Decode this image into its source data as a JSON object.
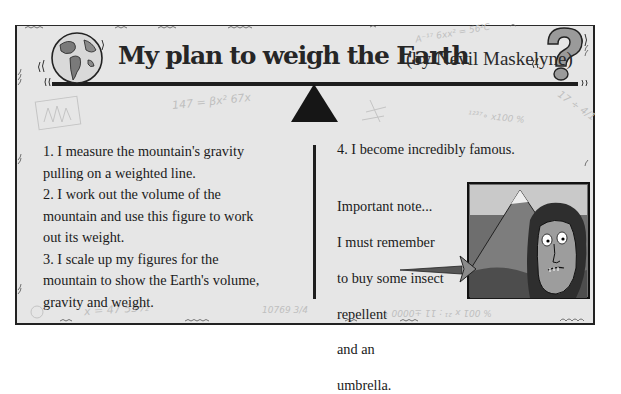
{
  "title": {
    "main": "My plan to weigh the Earth",
    "byline": "(by Nevil Maskelyne)"
  },
  "icons": {
    "left": "globe-icon",
    "right": "question-mark-icon",
    "center": "seesaw-fulcrum-icon"
  },
  "steps": [
    {
      "number": "1.",
      "text": "I measure the mountain's gravity pulling on a weighted line."
    },
    {
      "number": "2.",
      "text": "I work out the volume of the mountain and use this figure to work out its weight."
    },
    {
      "number": "3.",
      "text": "I scale up my figures for the mountain to show the Earth's volume, gravity and weight."
    },
    {
      "number": "4.",
      "text": "I become incredibly famous."
    }
  ],
  "step_lines": {
    "l1": "1.  I measure the mountain's gravity",
    "l2": "pulling on a weighted line.",
    "l3": "2.  I work out the volume of the",
    "l4": "mountain and use this figure to work",
    "l5": "out its weight.",
    "l6": "3.  I scale up my figures for the",
    "l7": "mountain to show the Earth's volume,",
    "l8": "gravity and weight.",
    "l9": "4.  I become incredibly famous."
  },
  "note": {
    "lines": [
      "Important note...",
      "I must remember",
      "to buy some insect",
      "repellent",
      "and an",
      "umbrella."
    ]
  },
  "illustration": {
    "description": "Cartoon of a wild-haired man in front of a mountain",
    "icon": "mountain-portrait-illustration"
  },
  "doodles": {
    "d1": "147 = βx² 67x",
    "d2": "A⁻¹⁷ 6xx² = 56²C",
    "d3": "¹²³⁷∘ x100 %",
    "d4": "17 ÷ 4/1",
    "d5": "x = 47  53½",
    "d6": "10769 3/4",
    "d7": "% 001 x ²¹ : 11 ±0000 ¹",
    "d8": "x",
    "d9": "y"
  },
  "colors": {
    "panel": "#e6e6e6",
    "ink": "#1a1a1a",
    "doodle": "#bfbfbf"
  }
}
